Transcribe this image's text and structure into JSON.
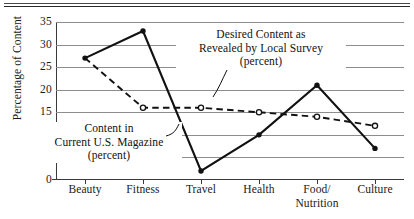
{
  "chart_data": {
    "type": "line",
    "title": "",
    "xlabel": "",
    "ylabel": "Percentage of Content",
    "ylim": [
      0,
      35
    ],
    "ytick_step": 5,
    "yticks": [
      "0",
      "5",
      "10",
      "15",
      "20",
      "25",
      "30",
      "35"
    ],
    "grid": true,
    "legend_position": "annotations-inline",
    "categories": [
      "Beauty",
      "Fitness",
      "Travel",
      "Health",
      "Food/Nutrition",
      "Culture"
    ],
    "category_lines": [
      [
        "Beauty"
      ],
      [
        "Fitness"
      ],
      [
        "Travel"
      ],
      [
        "Health"
      ],
      [
        "Food/",
        "Nutrition"
      ],
      [
        "Culture"
      ]
    ],
    "series": [
      {
        "name": "Content in Current U.S. Magazine (percent)",
        "style": "solid",
        "marker": "filled-circle",
        "values": [
          27,
          33,
          2,
          10,
          21,
          7
        ]
      },
      {
        "name": "Desired Content as Revealed by Local Survey (percent)",
        "style": "dashed",
        "marker": "open-circle",
        "values": [
          27,
          16,
          16,
          15,
          14,
          12
        ]
      }
    ],
    "annotations": [
      {
        "id": "desired",
        "lines": [
          "Desired Content as",
          "Revealed by Local Survey",
          "(percent)"
        ],
        "points_to_series": "Desired Content as Revealed by Local Survey (percent)"
      },
      {
        "id": "current",
        "lines": [
          "Content in",
          "Current U.S. Magazine",
          "(percent)"
        ],
        "points_to_series": "Content in Current U.S. Magazine (percent)"
      }
    ],
    "colors": {
      "ink": "#111111",
      "gridline": "#8d8d8d",
      "axis": "#3a3a3a",
      "background": "#ffffff"
    }
  }
}
